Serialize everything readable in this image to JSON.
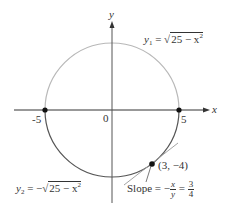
{
  "diagram": {
    "type": "circle-graph",
    "axes": {
      "x_label": "x",
      "y_label": "y",
      "origin_label": "0",
      "tick_labels": [
        "-5",
        "5"
      ]
    },
    "curves": [
      {
        "name": "upper",
        "label_var": "y",
        "label_sub": "1",
        "label_rhs_prefix": "= ",
        "label_radical": "25 − x",
        "label_radical_sup": "2",
        "color": "#b8b8b8"
      },
      {
        "name": "lower",
        "label_var": "y",
        "label_sub": "2",
        "label_rhs_prefix": "= −",
        "label_radical": "25 − x",
        "label_radical_sup": "2",
        "color": "#555555"
      }
    ],
    "points": [
      {
        "label": "(-5, 0)"
      },
      {
        "label": "(5, 0)"
      },
      {
        "label": "(3, −4)"
      }
    ],
    "slope_annotation": {
      "prefix": "Slope = −",
      "frac1_num": "x",
      "frac1_den": "y",
      "equals": "=",
      "frac2_num": "3",
      "frac2_den": "4"
    },
    "colors": {
      "axis": "#333333",
      "upper_curve": "#b8b8b8",
      "lower_curve": "#555555",
      "tangent": "#999999",
      "point": "#111111"
    }
  }
}
